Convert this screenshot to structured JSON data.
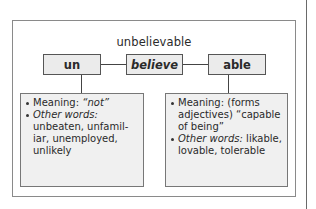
{
  "diagram": {
    "title": "unbelievable",
    "morphemes": [
      {
        "label": "un",
        "style": "bold"
      },
      {
        "label": "believe",
        "style": "bold-italic"
      },
      {
        "label": "able",
        "style": "bold"
      }
    ],
    "details": {
      "prefix": {
        "meaning_label": "Meaning:",
        "meaning_value": "“not”",
        "other_label": "Other words:",
        "other_value": "unbeaten, unfamil-iar, unemployed, unlikely"
      },
      "suffix": {
        "meaning_label": "Meaning:",
        "meaning_value": "(forms adjectives) “capable of being”",
        "other_label": "Other words:",
        "other_value": "likable, lovable, tolerable"
      }
    },
    "colors": {
      "box_fill": "#ebebeb",
      "info_fill": "#f0f0f0",
      "border": "#555555"
    }
  }
}
